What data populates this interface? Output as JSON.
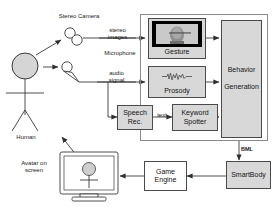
{
  "diagram": {
    "type": "block-flow-diagram",
    "actors": {
      "human_label": "Human",
      "avatar_label": "Avatar on\nscreen"
    },
    "sensors": [
      {
        "id": "stereo-camera",
        "label": "Stereo Camera"
      },
      {
        "id": "microphone",
        "label": "Microphone"
      }
    ],
    "signal_labels": [
      {
        "id": "stereo-images",
        "label": "stereo\nimages"
      },
      {
        "id": "audio-signal",
        "label": "audio\nsignal"
      },
      {
        "id": "text",
        "label": "text"
      },
      {
        "id": "bml",
        "label": "BML"
      }
    ],
    "modules": [
      {
        "id": "speech-rec",
        "label": "Speech\nRec.",
        "fill": "#d8d8d8"
      },
      {
        "id": "gesture",
        "label": "Gesture",
        "fill": "#d8d8d8"
      },
      {
        "id": "prosody",
        "label": "Prosody",
        "fill": "#d8d8d8"
      },
      {
        "id": "keyword-spotter",
        "label": "Keyword\nSpotter",
        "fill": "#d8d8d8"
      },
      {
        "id": "behavior-generation",
        "label": "Behavior\n\nGeneration",
        "fill": "#d8d8d8"
      },
      {
        "id": "smartbody",
        "label": "SmartBody",
        "fill": "#d8d8d8"
      },
      {
        "id": "game-engine",
        "label": "Game\nEngine",
        "fill": "#ffffff"
      }
    ],
    "colors": {
      "stroke": "#3a3a3a",
      "module_fill": "#d8d8d8",
      "module_border": "#4a4a4a",
      "group_border": "#8a8a8a",
      "text": "#141414",
      "background": "#ffffff"
    }
  }
}
